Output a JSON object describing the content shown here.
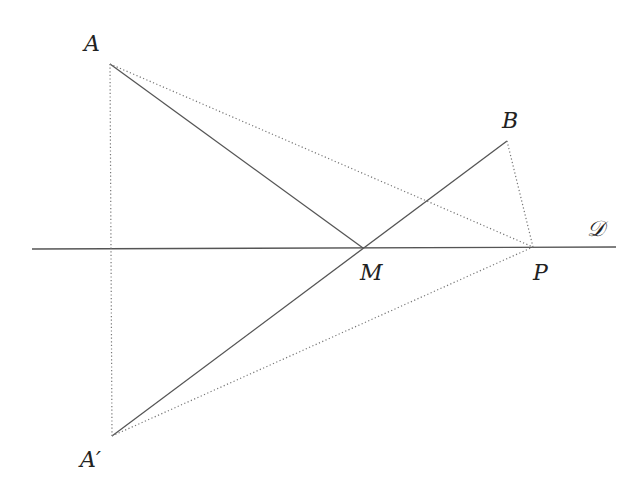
{
  "diagram": {
    "type": "geometry-reflection",
    "colors": {
      "solid_line": "#555555",
      "dotted_line": "#777777",
      "label": "#222222",
      "background": "#ffffff"
    },
    "points": {
      "A": {
        "label": "A",
        "x": 110,
        "y": 64,
        "label_x": 84,
        "label_y": 51
      },
      "B": {
        "label": "B",
        "x": 507,
        "y": 141,
        "label_x": 502,
        "label_y": 128
      },
      "M": {
        "label": "M",
        "x": 363,
        "y": 248,
        "label_x": 360,
        "label_y": 280
      },
      "P": {
        "label": "P",
        "x": 533,
        "y": 247,
        "label_x": 533,
        "label_y": 280
      },
      "A_prime": {
        "label": "A′",
        "x": 112,
        "y": 436,
        "label_x": 80,
        "label_y": 467
      }
    },
    "line_D": {
      "label": "𝒟",
      "x1": 32,
      "y1": 249,
      "x2": 616,
      "y2": 247,
      "label_x": 587,
      "label_y": 236
    },
    "segments": {
      "solid": [
        {
          "from": "A",
          "to": "M"
        },
        {
          "from": "A_prime",
          "to": "B"
        }
      ],
      "dotted": [
        {
          "from": "A",
          "to": "A_prime"
        },
        {
          "from": "A",
          "to": "P"
        },
        {
          "from": "A_prime",
          "to": "P"
        },
        {
          "from": "B",
          "to": "P"
        }
      ]
    }
  }
}
